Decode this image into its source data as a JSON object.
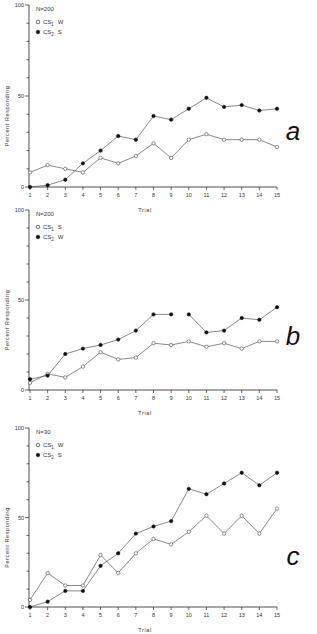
{
  "chart_data": [
    {
      "type": "line",
      "panel": "a",
      "title": "",
      "annotation": "N=200",
      "xlabel": "Trial",
      "ylabel": "Percent Responding",
      "x": [
        1,
        2,
        3,
        4,
        5,
        6,
        7,
        8,
        9,
        10,
        11,
        12,
        13,
        14,
        15
      ],
      "ylim": [
        0,
        100
      ],
      "yticks": [
        0,
        50,
        100
      ],
      "grid": false,
      "legend_position": "upper-left",
      "series": [
        {
          "name": "CS1 W",
          "marker": "open-circle",
          "values": [
            8,
            12,
            10,
            8,
            16,
            13,
            17,
            24,
            16,
            26,
            29,
            26,
            26,
            26,
            22
          ]
        },
        {
          "name": "CS2 S",
          "marker": "filled-circle",
          "values": [
            0,
            1,
            4,
            13,
            20,
            28,
            26,
            39,
            37,
            43,
            49,
            44,
            45,
            42,
            43
          ]
        }
      ]
    },
    {
      "type": "line",
      "panel": "b",
      "title": "",
      "annotation": "N=200",
      "xlabel": "Trial",
      "ylabel": "Percent Responding",
      "x": [
        1,
        2,
        3,
        4,
        5,
        6,
        7,
        8,
        9,
        10,
        11,
        12,
        13,
        14,
        15
      ],
      "ylim": [
        0,
        100
      ],
      "yticks": [
        0,
        50,
        100
      ],
      "grid": false,
      "legend_position": "upper-left",
      "series": [
        {
          "name": "CS1 S",
          "marker": "open-circle",
          "values": [
            4,
            9,
            7,
            13,
            21,
            17,
            18,
            26,
            25,
            27,
            24,
            26,
            23,
            27,
            27
          ]
        },
        {
          "name": "CS2 W",
          "marker": "filled-circle",
          "values": [
            6,
            8,
            20,
            23,
            25,
            28,
            33,
            42,
            42,
            42,
            32,
            33,
            40,
            39,
            46
          ],
          "line_break_after_index": 8
        }
      ]
    },
    {
      "type": "line",
      "panel": "c",
      "title": "",
      "annotation": "N=30",
      "xlabel": "Trial",
      "ylabel": "Percent Responding",
      "x": [
        1,
        2,
        3,
        4,
        5,
        6,
        7,
        8,
        9,
        10,
        11,
        12,
        13,
        14,
        15
      ],
      "ylim": [
        0,
        100
      ],
      "yticks": [
        0,
        50,
        100
      ],
      "grid": false,
      "legend_position": "upper-left",
      "series": [
        {
          "name": "CS1 W",
          "marker": "open-circle",
          "values": [
            4,
            19,
            12,
            12,
            29,
            19,
            30,
            38,
            35,
            42,
            51,
            41,
            51,
            41,
            55
          ]
        },
        {
          "name": "CS2 S",
          "marker": "filled-circle",
          "values": [
            0,
            3,
            9,
            9,
            23,
            30,
            41,
            45,
            48,
            66,
            63,
            69,
            75,
            68,
            75
          ]
        }
      ]
    }
  ],
  "panels": [
    {
      "letter": "a",
      "n_label": "N=200",
      "legend": [
        {
          "cs": "CS",
          "sub": "1",
          "type": "W"
        },
        {
          "cs": "CS",
          "sub": "2",
          "type": "S"
        }
      ]
    },
    {
      "letter": "b",
      "n_label": "N=200",
      "legend": [
        {
          "cs": "CS",
          "sub": "1",
          "type": "S"
        },
        {
          "cs": "CS",
          "sub": "2",
          "type": "W"
        }
      ]
    },
    {
      "letter": "c",
      "n_label": "N=30",
      "legend": [
        {
          "cs": "CS",
          "sub": "1",
          "type": "W"
        },
        {
          "cs": "CS",
          "sub": "2",
          "type": "S"
        }
      ]
    }
  ],
  "axis": {
    "xlabel": "Trial",
    "ylabel": "Percent Responding",
    "y_tick_labels": [
      "0",
      "50",
      "100"
    ]
  },
  "colors": {
    "line": "#555555",
    "marker_fill": "#111111",
    "axis": "#222222"
  }
}
